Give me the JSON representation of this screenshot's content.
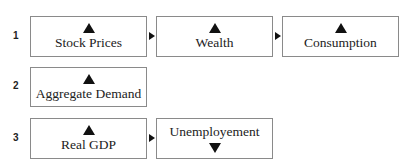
{
  "rows": [
    {
      "number": "1",
      "boxes": [
        {
          "label": "Stock Prices",
          "direction": "up"
        },
        {
          "label": "Wealth",
          "direction": "up"
        },
        {
          "label": "Consumption",
          "direction": "up"
        }
      ]
    },
    {
      "number": "2",
      "boxes": [
        {
          "label": "Aggregate Demand",
          "direction": "up"
        }
      ]
    },
    {
      "number": "3",
      "boxes": [
        {
          "label": "Real GDP",
          "direction": "up"
        },
        {
          "label": "Unemployement",
          "direction": "down"
        }
      ]
    }
  ],
  "icons": {
    "increase": "triangle-up",
    "decrease": "triangle-down",
    "connector": "triangle-right"
  }
}
